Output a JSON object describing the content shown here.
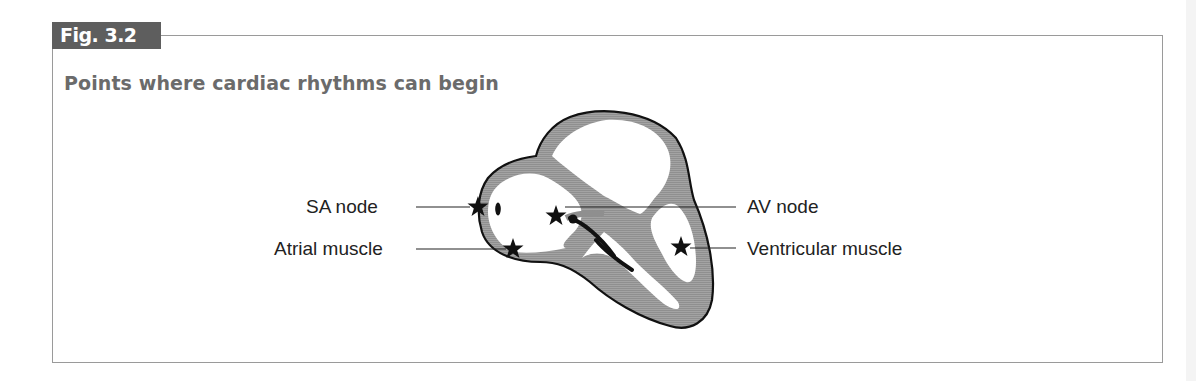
{
  "figure": {
    "badge": "Fig. 3.2",
    "title": "Points where cardiac rhythms can begin",
    "colors": {
      "badge_bg": "#5e5e5e",
      "title_text": "#6b6b6b",
      "heart_wall": "#9c9c9c",
      "outline": "#111111",
      "frame": "#9a9a9a"
    }
  },
  "labels": {
    "sa_node": "SA node",
    "atrial_muscle": "Atrial muscle",
    "av_node": "AV node",
    "ventricular_muscle": "Ventricular muscle"
  },
  "markers": [
    {
      "name": "SA node",
      "icon": "star-icon"
    },
    {
      "name": "Atrial muscle",
      "icon": "star-icon"
    },
    {
      "name": "AV node",
      "icon": "star-icon"
    },
    {
      "name": "Ventricular muscle",
      "icon": "star-icon"
    }
  ]
}
